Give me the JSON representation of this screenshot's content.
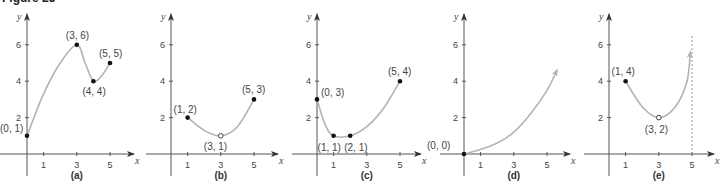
{
  "figure_title": "Figure 25",
  "chart_data": [
    {
      "type": "line",
      "panel": "(a)",
      "xlabel": "x",
      "ylabel": "y",
      "xticks": [
        1,
        3,
        5
      ],
      "yticks": [
        2,
        4,
        6
      ],
      "labeled_points": [
        {
          "label": "(0, 1)",
          "x": 0,
          "y": 1,
          "marker": "closed"
        },
        {
          "label": "(3, 6)",
          "x": 3,
          "y": 6,
          "marker": "closed"
        },
        {
          "label": "(4, 4)",
          "x": 4,
          "y": 4,
          "marker": "closed"
        },
        {
          "label": "(5, 5)",
          "x": 5,
          "y": 5,
          "marker": "closed"
        }
      ],
      "curve": [
        [
          0,
          1
        ],
        [
          1,
          3.3
        ],
        [
          2,
          5
        ],
        [
          3,
          6
        ],
        [
          3.5,
          5
        ],
        [
          4,
          4
        ],
        [
          4.5,
          4.3
        ],
        [
          5,
          5
        ]
      ]
    },
    {
      "type": "line",
      "panel": "(b)",
      "xlabel": "x",
      "ylabel": "y",
      "xticks": [
        1,
        3,
        5
      ],
      "yticks": [
        2,
        4,
        6
      ],
      "labeled_points": [
        {
          "label": "(1, 2)",
          "x": 1,
          "y": 2,
          "marker": "closed"
        },
        {
          "label": "(3, 1)",
          "x": 3,
          "y": 1,
          "marker": "open"
        },
        {
          "label": "(5, 3)",
          "x": 5,
          "y": 3,
          "marker": "closed"
        }
      ],
      "curve": [
        [
          1,
          2
        ],
        [
          2,
          1.3
        ],
        [
          3,
          1
        ],
        [
          4,
          1.5
        ],
        [
          5,
          3
        ]
      ]
    },
    {
      "type": "line",
      "panel": "(c)",
      "xlabel": "x",
      "ylabel": "y",
      "xticks": [
        1,
        3,
        5
      ],
      "yticks": [
        2,
        4,
        6
      ],
      "labeled_points": [
        {
          "label": "(0, 3)",
          "x": 0,
          "y": 3,
          "marker": "closed"
        },
        {
          "label": "(1, 1)",
          "x": 1,
          "y": 1,
          "marker": "closed"
        },
        {
          "label": "(2, 1)",
          "x": 2,
          "y": 1,
          "marker": "closed"
        },
        {
          "label": "(5, 4)",
          "x": 5,
          "y": 4,
          "marker": "closed"
        }
      ],
      "curve": [
        [
          0,
          3
        ],
        [
          0.5,
          1.6
        ],
        [
          1,
          1
        ],
        [
          2,
          1
        ],
        [
          3,
          1.5
        ],
        [
          4,
          2.5
        ],
        [
          5,
          4
        ]
      ]
    },
    {
      "type": "line",
      "panel": "(d)",
      "xlabel": "x",
      "ylabel": "y",
      "xticks": [
        1,
        3,
        5
      ],
      "yticks": [
        2,
        4,
        6
      ],
      "labeled_points": [
        {
          "label": "(0, 0)",
          "x": 0,
          "y": 0,
          "marker": "closed"
        }
      ],
      "curve": [
        [
          0,
          0
        ],
        [
          1,
          0.25
        ],
        [
          2,
          0.6
        ],
        [
          3,
          1.2
        ],
        [
          4,
          2.2
        ],
        [
          5,
          3.5
        ],
        [
          5.6,
          4.6
        ]
      ],
      "arrow_end": true
    },
    {
      "type": "line",
      "panel": "(e)",
      "xlabel": "x",
      "ylabel": "y",
      "xticks": [
        1,
        3,
        5
      ],
      "yticks": [
        2,
        4,
        6
      ],
      "labeled_points": [
        {
          "label": "(1, 4)",
          "x": 1,
          "y": 4,
          "marker": "closed"
        },
        {
          "label": "(3, 2)",
          "x": 3,
          "y": 2,
          "marker": "open"
        }
      ],
      "curve": [
        [
          1,
          4
        ],
        [
          2,
          2.6
        ],
        [
          3,
          2
        ],
        [
          4,
          2.6
        ],
        [
          4.7,
          4
        ],
        [
          4.9,
          5.6
        ]
      ],
      "arrow_end": true,
      "vertical_asymptote": 5
    }
  ]
}
